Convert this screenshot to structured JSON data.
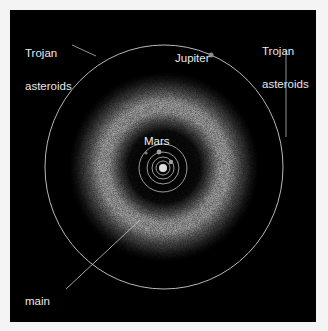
{
  "figure": {
    "background": "#000000",
    "border_color": "#f4f4f4",
    "labels": {
      "trojan_left": [
        "Trojan",
        "asteroids"
      ],
      "trojan_right": [
        "Trojan",
        "asteroids"
      ],
      "jupiter": "Jupiter",
      "mars": "Mars",
      "main_belt": [
        "main",
        "asteroid",
        "belt"
      ]
    },
    "colors": {
      "orbit_line": "#b8b8b8",
      "label_text": "#e8e8e8",
      "belt": "#d8d8d8",
      "sun": "#dddddd",
      "planet": "#9a9a9a"
    }
  }
}
